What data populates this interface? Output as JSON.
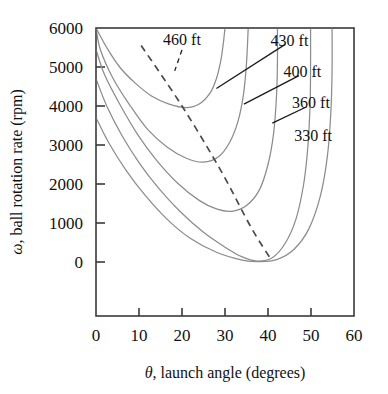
{
  "chart_data": {
    "type": "line",
    "title": "",
    "xlabel": "θ, launch angle (degrees)",
    "ylabel": "ω, ball rotation rate (rpm)",
    "xlim": [
      0,
      60
    ],
    "ylim": [
      0,
      6000
    ],
    "xticks": [
      "0",
      "10",
      "20",
      "30",
      "40",
      "50",
      "60"
    ],
    "xtick_values": [
      0,
      10,
      20,
      30,
      40,
      50,
      60
    ],
    "yticks": [
      "0",
      "1000",
      "2000",
      "3000",
      "4000",
      "5000",
      "6000"
    ],
    "ytick_values": [
      0,
      1000,
      2000,
      3000,
      4000,
      5000,
      6000
    ],
    "grid": false,
    "legend_position": "inline-annotations",
    "curve_color": "#8c8c8c",
    "axis_color": "#3a3a3a",
    "annotation_color": "#1a1a1a",
    "contour_label_unit": "ft",
    "series": [
      {
        "name": "460 ft",
        "label": "460 ft",
        "comment": "innermost contour, nose near 21 deg / 3950 rpm",
        "points": [
          [
            0.0,
            6000
          ],
          [
            2.5,
            5500
          ],
          [
            5.5,
            5000
          ],
          [
            9.0,
            4600
          ],
          [
            13.0,
            4250
          ],
          [
            17.0,
            4050
          ],
          [
            21.0,
            3960
          ],
          [
            24.0,
            4050
          ],
          [
            26.5,
            4330
          ],
          [
            28.0,
            4700
          ],
          [
            29.0,
            5150
          ],
          [
            29.6,
            5600
          ],
          [
            30.0,
            6000
          ]
        ]
      },
      {
        "name": "430 ft",
        "label": "430 ft",
        "comment": "nose near 25 deg / 2560 rpm",
        "points": [
          [
            0.0,
            6000
          ],
          [
            1.0,
            5450
          ],
          [
            4.0,
            4700
          ],
          [
            8.0,
            4000
          ],
          [
            12.0,
            3400
          ],
          [
            16.5,
            2950
          ],
          [
            21.0,
            2660
          ],
          [
            25.0,
            2560
          ],
          [
            28.5,
            2700
          ],
          [
            31.0,
            3050
          ],
          [
            33.0,
            3600
          ],
          [
            34.3,
            4300
          ],
          [
            35.0,
            5100
          ],
          [
            35.4,
            6000
          ]
        ]
      },
      {
        "name": "400 ft",
        "label": "400 ft",
        "comment": "nose near 31 deg / 1300 rpm",
        "points": [
          [
            0.0,
            5450
          ],
          [
            2.0,
            4800
          ],
          [
            5.5,
            4050
          ],
          [
            9.5,
            3300
          ],
          [
            14.0,
            2620
          ],
          [
            19.0,
            2020
          ],
          [
            24.0,
            1580
          ],
          [
            28.0,
            1360
          ],
          [
            31.5,
            1300
          ],
          [
            35.0,
            1450
          ],
          [
            38.0,
            1850
          ],
          [
            40.0,
            2500
          ],
          [
            41.3,
            3300
          ],
          [
            42.0,
            4300
          ],
          [
            42.2,
            5200
          ],
          [
            42.2,
            6000
          ]
        ]
      },
      {
        "name": "360 ft",
        "label": "360 ft",
        "comment": "nose near 37 deg / 0 rpm",
        "points": [
          [
            0.0,
            4700
          ],
          [
            2.5,
            4000
          ],
          [
            6.0,
            3250
          ],
          [
            10.0,
            2550
          ],
          [
            14.5,
            1900
          ],
          [
            19.5,
            1300
          ],
          [
            25.0,
            760
          ],
          [
            30.0,
            380
          ],
          [
            34.0,
            130
          ],
          [
            37.5,
            25
          ],
          [
            41.0,
            110
          ],
          [
            44.0,
            480
          ],
          [
            46.5,
            1100
          ],
          [
            48.3,
            2000
          ],
          [
            49.3,
            3000
          ],
          [
            49.8,
            4100
          ],
          [
            49.9,
            5100
          ],
          [
            49.9,
            6000
          ]
        ]
      },
      {
        "name": "330 ft",
        "label": "330 ft",
        "comment": "outermost contour shown, enters plot low-left and exits top",
        "points": [
          [
            0.0,
            3700
          ],
          [
            3.0,
            3050
          ],
          [
            7.0,
            2350
          ],
          [
            11.5,
            1700
          ],
          [
            16.5,
            1100
          ],
          [
            22.0,
            600
          ],
          [
            28.0,
            250
          ],
          [
            34.0,
            50
          ],
          [
            38.0,
            10
          ],
          [
            42.0,
            60
          ],
          [
            46.0,
            320
          ],
          [
            49.5,
            850
          ],
          [
            52.2,
            1700
          ],
          [
            53.8,
            2700
          ],
          [
            54.6,
            3800
          ],
          [
            54.9,
            4900
          ],
          [
            54.9,
            6000
          ]
        ]
      }
    ],
    "dashed_line": {
      "name": "optimum-locus",
      "style": "dashed",
      "color": "#4a4a4a",
      "comment": "locus of noses / optimum launch condition",
      "points": [
        [
          10.5,
          5550
        ],
        [
          20.0,
          4000
        ],
        [
          29.0,
          2350
        ],
        [
          36.0,
          900
        ],
        [
          40.5,
          100
        ]
      ]
    },
    "annotations": [
      {
        "name": "annotation-460",
        "text": "460 ft",
        "text_x": 20.0,
        "text_y": 5720,
        "leader": {
          "from": [
            20.0,
            5440
          ],
          "to": [
            18.3,
            4900
          ]
        },
        "leader_style": "dashed-short"
      },
      {
        "name": "annotation-430",
        "text": "430 ft",
        "text_x": 45.0,
        "text_y": 5700,
        "leader": {
          "from": [
            44.0,
            5580
          ],
          "to": [
            28.0,
            4450
          ]
        },
        "leader_style": "solid"
      },
      {
        "name": "annotation-400",
        "text": "400 ft",
        "text_x": 48.0,
        "text_y": 4900,
        "leader": {
          "from": [
            47.2,
            4780
          ],
          "to": [
            34.4,
            4050
          ]
        },
        "leader_style": "solid"
      },
      {
        "name": "annotation-360",
        "text": "360 ft",
        "text_x": 50.0,
        "text_y": 4100,
        "leader": {
          "from": [
            49.0,
            3980
          ],
          "to": [
            41.0,
            3560
          ]
        },
        "leader_style": "solid"
      },
      {
        "name": "annotation-330",
        "text": "330 ft",
        "text_x": 50.5,
        "text_y": 3250,
        "leader": null,
        "leader_style": "none"
      }
    ]
  }
}
